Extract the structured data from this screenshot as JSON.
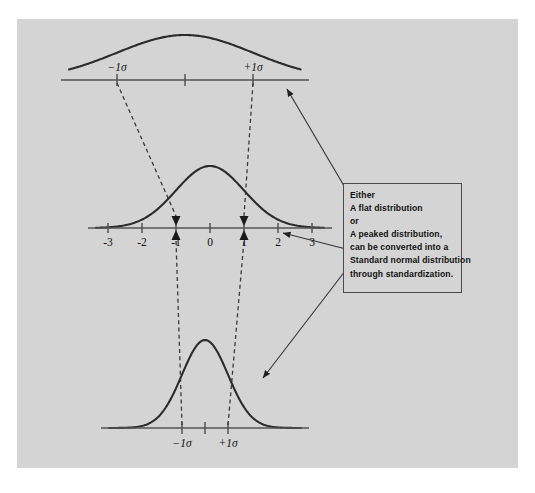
{
  "figure": {
    "background_color": "#ffffff",
    "panel_color": "#d4d4d4",
    "curve_color": "#2b2b2b",
    "axis_color": "#555555",
    "dashed_color": "#3a3a3a",
    "arrow_color": "#222222",
    "text_color": "#111111"
  },
  "note": {
    "lines": [
      "Either",
      "A flat distribution",
      "or",
      "A peaked distribution,",
      "can be converted into a",
      "Standard normal distribution",
      "through standardization."
    ]
  },
  "distributions": [
    {
      "id": "flat",
      "name": "flat-distribution",
      "label_position": "above-axis",
      "tick_labels": [
        "−1σ",
        "+1σ"
      ],
      "center_label": "",
      "sigma_px": 68,
      "amplitude_px": 45,
      "axis_y": 80,
      "center_x": 185,
      "axis_x1": 73,
      "axis_x2": 297
    },
    {
      "id": "standard",
      "name": "standard-normal-distribution",
      "label_position": "below-axis",
      "tick_labels": [
        "-3",
        "-2",
        "-1",
        "0",
        "1",
        "2",
        "3"
      ],
      "tick_values": [
        -3,
        -2,
        -1,
        0,
        1,
        2,
        3
      ],
      "sigma_px": 34,
      "amplitude_px": 62,
      "axis_y": 228,
      "center_x": 210,
      "axis_x1": 100,
      "axis_x2": 320
    },
    {
      "id": "peaked",
      "name": "peaked-distribution",
      "label_position": "below-axis",
      "tick_labels": [
        "−1σ",
        "+1σ"
      ],
      "sigma_px": 23,
      "amplitude_px": 88,
      "axis_y": 428,
      "center_x": 205,
      "axis_x1": 113,
      "axis_x2": 297
    }
  ],
  "chart_data": {
    "type": "line",
    "title": "",
    "xlabel": "",
    "ylabel": "",
    "series": [
      {
        "name": "A flat distribution",
        "sigma": 2.0,
        "mean": 0,
        "peak_relative": 0.5
      },
      {
        "name": "Standard normal distribution",
        "sigma": 1.0,
        "mean": 0,
        "peak_relative": 1.0
      },
      {
        "name": "A peaked distribution",
        "sigma": 0.67,
        "mean": 0,
        "peak_relative": 1.5
      }
    ],
    "annotations": [
      "Either",
      "A flat distribution",
      "or",
      "A peaked distribution,",
      "can be converted into a",
      "Standard normal distribution",
      "through standardization."
    ],
    "grid": false,
    "legend": "none"
  },
  "connectors": {
    "dashed_from_flat": [
      "−1σ → -1",
      "+1σ → +1"
    ],
    "dashed_from_peaked": [
      "−1σ → -1",
      "+1σ → +1"
    ]
  },
  "callout_arrows": [
    {
      "name": "arrow-to-flat-distribution",
      "target": "flat"
    },
    {
      "name": "arrow-to-standard-normal",
      "target": "standard"
    },
    {
      "name": "arrow-to-peaked-distribution",
      "target": "peaked"
    }
  ]
}
